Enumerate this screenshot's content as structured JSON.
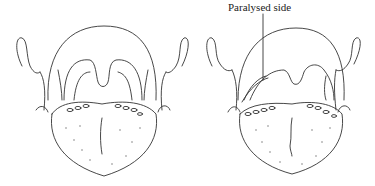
{
  "figure": {
    "panels": [
      {
        "name": "normal",
        "label": ""
      },
      {
        "name": "paralysed",
        "label": "Paralysed side"
      }
    ],
    "annotation": "Paralysed side",
    "colors": {
      "line": "#333333",
      "background": "#ffffff"
    }
  }
}
